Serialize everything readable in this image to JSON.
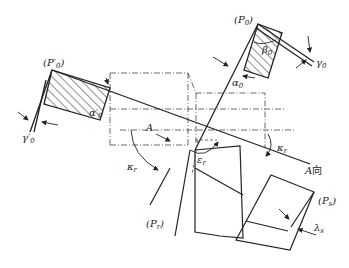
{
  "diagram": {
    "type": "tool-angle-diagram",
    "colors": {
      "line": "#222222",
      "background": "#ffffff"
    },
    "labels": {
      "P0": {
        "open": "(",
        "main": "P",
        "sub": "0",
        "close": ")"
      },
      "P0_prime": {
        "open": "(",
        "main": "P′",
        "sub": "0",
        "close": ")"
      },
      "Pr": {
        "open": "(",
        "main": "P",
        "sub": "r",
        "close": ")"
      },
      "Ps": {
        "open": "(",
        "main": "P",
        "sub": "s",
        "close": ")"
      },
      "beta0": {
        "main": "β",
        "sub": "0"
      },
      "gamma0": {
        "main": "γ",
        "sub": "0"
      },
      "alpha0": {
        "main": "α",
        "sub": "0"
      },
      "alpha0_prime": {
        "main": "α′",
        "sub": "0"
      },
      "gamma0_prime": {
        "main": "γ′",
        "sub": "0"
      },
      "A": {
        "main": "A"
      },
      "kappa_r_left": {
        "main": "κ",
        "sub": "r"
      },
      "kappa_r_right": {
        "main": "κ",
        "sub": "r"
      },
      "epsilon_r": {
        "main": "ε",
        "sub": "r"
      },
      "lambda_s": {
        "main": "λ",
        "sub": "s"
      },
      "view_A": {
        "main": "A",
        "suffix": "向"
      }
    }
  }
}
